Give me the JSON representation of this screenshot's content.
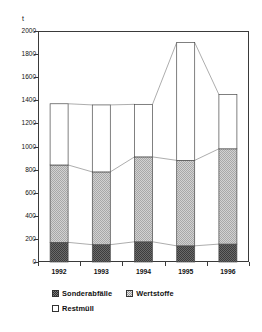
{
  "chart_data": {
    "type": "bar",
    "subtype": "stacked-bar-with-connectors",
    "title": "",
    "xlabel": "",
    "ylabel": "t",
    "unit": "t",
    "categories": [
      "1992",
      "1993",
      "1994",
      "1995",
      "1996"
    ],
    "ylim": [
      0,
      2000
    ],
    "yticks": [
      0,
      200,
      400,
      600,
      800,
      1000,
      1200,
      1400,
      1600,
      1800,
      2000
    ],
    "ytick_labels": [
      "0",
      "200",
      "400",
      "600",
      "800",
      "1000",
      "1200",
      "1400",
      "1600",
      "1800",
      "2000"
    ],
    "grid": false,
    "legend_position": "bottom",
    "series": [
      {
        "name": "Sonderabfälle",
        "fill": "dark-checker",
        "color": "#585858",
        "values": [
          170,
          150,
          175,
          140,
          155
        ]
      },
      {
        "name": "Wertstoffe",
        "fill": "light-dotted",
        "color": "#b8b8b8",
        "values": [
          670,
          630,
          735,
          740,
          825
        ]
      },
      {
        "name": "Restmüll",
        "fill": "white",
        "color": "#ffffff",
        "values": [
          530,
          580,
          455,
          1020,
          470
        ]
      }
    ],
    "cumulative_tops": {
      "sonderabfaelle": [
        170,
        150,
        175,
        140,
        155
      ],
      "wertstoffe": [
        840,
        780,
        910,
        880,
        980
      ],
      "total": [
        1370,
        1360,
        1365,
        1900,
        1450
      ]
    }
  },
  "legend": {
    "rows": [
      [
        {
          "label": "Sonderabfälle",
          "swatch": "dark-checker-swatch"
        },
        {
          "label": "Wertstoffe",
          "swatch": "light-dotted-swatch"
        }
      ],
      [
        {
          "label": "Restmüll",
          "swatch": "white-swatch"
        }
      ]
    ]
  },
  "colors": {
    "axis": "#3a3a3a",
    "series_dark": "#585858",
    "series_light": "#b8b8b8",
    "series_white": "#ffffff",
    "connector": "#8a8a8a",
    "text": "#111111"
  }
}
